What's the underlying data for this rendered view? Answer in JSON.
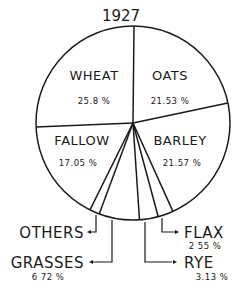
{
  "chart_data": {
    "type": "pie",
    "title": "1927",
    "categories": [
      "Oats",
      "Barley",
      "Flax",
      "Rye",
      "Grasses",
      "Others",
      "Fallow",
      "Wheat"
    ],
    "values": [
      21.53,
      21.57,
      2.55,
      3.13,
      6.72,
      1.65,
      17.05,
      25.8
    ],
    "unit": "%",
    "start_angle": "12 o'clock",
    "direction": "clockwise",
    "slices": [
      {
        "name": "OATS",
        "value": 21.53,
        "label": "21.53 %",
        "labeled_inside": true
      },
      {
        "name": "BARLEY",
        "value": 21.57,
        "label": "21.57%",
        "labeled_inside": true
      },
      {
        "name": "FLAX",
        "value": 2.55,
        "label": "2.55 %",
        "labeled_inside": false
      },
      {
        "name": "RYE",
        "value": 3.13,
        "label": "3.13 %",
        "labeled_inside": false
      },
      {
        "name": "GRASSES",
        "value": 6.72,
        "label": "6.72 %",
        "labeled_inside": false
      },
      {
        "name": "OTHERS",
        "value": 1.65,
        "label": "",
        "labeled_inside": false
      },
      {
        "name": "FALLOW",
        "value": 17.05,
        "label": "17.05%",
        "labeled_inside": true
      },
      {
        "name": "WHEAT",
        "value": 25.8,
        "label": "25.8 %",
        "labeled_inside": true
      }
    ],
    "style": "hand-drawn black line art on white",
    "legend": "none"
  },
  "title": "1927",
  "labels": {
    "wheat": {
      "name": "WHEAT",
      "pct": "25.8 %"
    },
    "oats": {
      "name": "OATS",
      "pct": "21.53 %"
    },
    "fallow": {
      "name": "FALLOW",
      "pct": "17.05 %"
    },
    "barley": {
      "name": "BARLEY",
      "pct": "21.57 %"
    },
    "others": {
      "name": "OTHERS"
    },
    "grasses": {
      "name": "GRASSES",
      "pct": "6 72 %"
    },
    "flax": {
      "name": "FLAX",
      "pct": "2 55 %"
    },
    "rye": {
      "name": "RYE",
      "pct": "3.13 %"
    }
  },
  "colors": {
    "ink": "#1a1a1a",
    "paper": "#ffffff"
  }
}
